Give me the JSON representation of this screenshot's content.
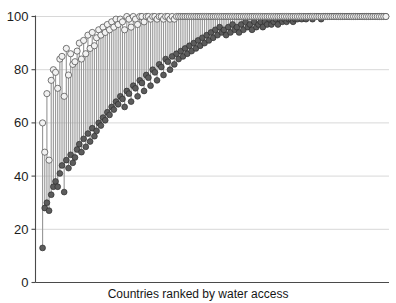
{
  "chart_data": {
    "type": "scatter",
    "subtype": "range-dumbbell",
    "title": "",
    "title_clipped": true,
    "xlabel": "Countries ranked by water access",
    "ylabel": "",
    "ylim": [
      0,
      100
    ],
    "yticks": [
      0,
      20,
      40,
      60,
      80,
      100
    ],
    "ytick_labels": [
      "0",
      "20",
      "40",
      "60",
      "80",
      "100"
    ],
    "xticks": [],
    "xtick_labels": [],
    "grid": "horizontal",
    "legend": "none",
    "series": [
      {
        "name": "upper marker (open circle)",
        "marker": "open-circle",
        "color": "#f2f2f2"
      },
      {
        "name": "lower marker (filled circle)",
        "marker": "filled-circle",
        "color": "#5c5c5c"
      },
      {
        "name": "range bar",
        "marker": "vertical-line",
        "color": "#9a9a9a"
      }
    ],
    "n_points": 160,
    "low": [
      13,
      28,
      30,
      27,
      33,
      36,
      38,
      36,
      41,
      44,
      34,
      46,
      43,
      48,
      45,
      47,
      50,
      52,
      49,
      54,
      51,
      56,
      53,
      58,
      55,
      57,
      60,
      59,
      62,
      61,
      64,
      63,
      66,
      65,
      68,
      67,
      70,
      69,
      66,
      72,
      71,
      68,
      74,
      73,
      70,
      76,
      75,
      72,
      78,
      77,
      74,
      80,
      79,
      76,
      82,
      81,
      78,
      84,
      83,
      80,
      85,
      82,
      86,
      84,
      87,
      85,
      88,
      86,
      89,
      87,
      90,
      88,
      91,
      89,
      92,
      90,
      93,
      91,
      94,
      92,
      95,
      93,
      96,
      94,
      95,
      93,
      96,
      94,
      97,
      95,
      96,
      94,
      97,
      95,
      98,
      96,
      97,
      95,
      98,
      96,
      97,
      98,
      96,
      98,
      97,
      99,
      97,
      98,
      99,
      97,
      99,
      98,
      99,
      98,
      99,
      99,
      98,
      99,
      99,
      100,
      99,
      100,
      99,
      100,
      100,
      99,
      100,
      100,
      100,
      99,
      100,
      100,
      100,
      100,
      100,
      100,
      100,
      100,
      100,
      100,
      100,
      100,
      100,
      100,
      100,
      100,
      100,
      100,
      100,
      100,
      100,
      100,
      100,
      100,
      100,
      100,
      100,
      100,
      100,
      100
    ],
    "high": [
      60,
      49,
      71,
      46,
      76,
      80,
      79,
      73,
      84,
      85,
      70,
      88,
      78,
      86,
      82,
      83,
      87,
      90,
      84,
      91,
      86,
      93,
      88,
      94,
      89,
      92,
      95,
      93,
      96,
      94,
      97,
      95,
      98,
      96,
      99,
      97,
      99,
      98,
      95,
      100,
      99,
      96,
      100,
      99,
      97,
      100,
      100,
      98,
      100,
      100,
      99,
      100,
      100,
      99,
      100,
      100,
      99,
      100,
      100,
      99,
      100,
      99,
      100,
      100,
      100,
      100,
      100,
      100,
      100,
      100,
      100,
      100,
      100,
      100,
      100,
      100,
      100,
      100,
      100,
      100,
      100,
      100,
      100,
      100,
      100,
      100,
      100,
      100,
      100,
      100,
      100,
      100,
      100,
      100,
      100,
      100,
      100,
      100,
      100,
      100,
      100,
      100,
      100,
      100,
      100,
      100,
      100,
      100,
      100,
      100,
      100,
      100,
      100,
      100,
      100,
      100,
      100,
      100,
      100,
      100,
      100,
      100,
      100,
      100,
      100,
      100,
      100,
      100,
      100,
      100,
      100,
      100,
      100,
      100,
      100,
      100,
      100,
      100,
      100,
      100,
      100,
      100,
      100,
      100,
      100,
      100,
      100,
      100,
      100,
      100,
      100,
      100,
      100,
      100,
      100,
      100,
      100,
      100,
      100,
      100
    ]
  },
  "axis": {
    "x_title": "Countries ranked by water access"
  },
  "title_remnant": ""
}
